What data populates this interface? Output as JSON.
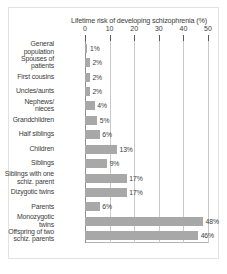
{
  "chart_data": {
    "type": "bar",
    "orientation": "horizontal",
    "title": "Lifetime risk of developing schizophrenia (%)",
    "xlabel": "",
    "ylabel": "",
    "xlim": [
      0,
      50
    ],
    "xticks": [
      "0",
      "10",
      "20",
      "30",
      "40",
      "50"
    ],
    "grid": true,
    "legend": false,
    "bar_color": "#a8a8a8",
    "categories": [
      "General population",
      "Spouses of patients",
      "First cousins",
      "Uncles/aunts",
      "Nephews/ nieces",
      "Grandchildren",
      "Half siblings",
      "Children",
      "Siblings",
      "Siblings with one schiz. parent",
      "Dizygotic twins",
      "Parents",
      "Monozygotic twins",
      "Offspring of two schiz. parents"
    ],
    "category_lines": [
      [
        "General",
        "population"
      ],
      [
        "Spouses of",
        "patients"
      ],
      [
        "First cousins"
      ],
      [
        "Uncles/aunts"
      ],
      [
        "Nephews/",
        "nieces"
      ],
      [
        "Grandchildren"
      ],
      [
        "Half siblings"
      ],
      [
        "Children"
      ],
      [
        "Siblings"
      ],
      [
        "Siblings with one",
        "schiz. parent"
      ],
      [
        "Dizygotic twins"
      ],
      [
        "Parents"
      ],
      [
        "Monozygotic",
        "twins"
      ],
      [
        "Offspring of two",
        "schiz. parents"
      ]
    ],
    "values": [
      1,
      2,
      2,
      2,
      4,
      5,
      6,
      13,
      9,
      17,
      17,
      6,
      48,
      46
    ],
    "value_labels": [
      "1%",
      "2%",
      "2%",
      "2%",
      "4%",
      "5%",
      "6%",
      "13%",
      "9%",
      "17%",
      "17%",
      "6%",
      "48%",
      "46%"
    ]
  }
}
